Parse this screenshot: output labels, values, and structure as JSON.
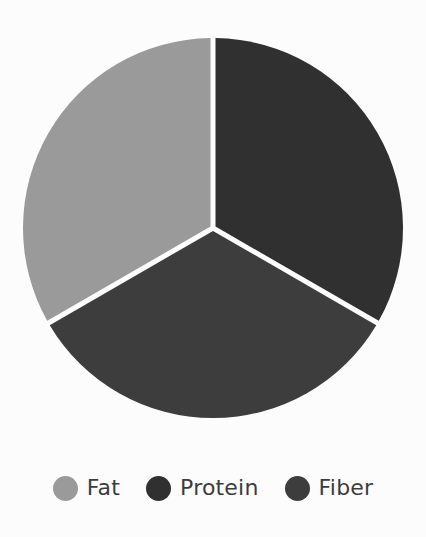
{
  "chart_data": {
    "type": "pie",
    "title": "",
    "subtitle": "",
    "xlabel": "",
    "ylabel": "",
    "grid": false,
    "legend_position": "bottom",
    "start_angle_deg": 0,
    "direction": "clockwise",
    "categories": [
      "Fat",
      "Protein",
      "Fiber"
    ],
    "values": [
      33.3,
      33.3,
      33.3
    ],
    "slices": [
      {
        "label": "Fat",
        "value": 33.3,
        "percent": "33.3%",
        "color": "#9a9a9a",
        "start_angle_deg": 240,
        "end_angle_deg": 360,
        "sweep_deg": 120,
        "position": "upper-left"
      },
      {
        "label": "Protein",
        "value": 33.3,
        "percent": "33.3%",
        "color": "#303030",
        "start_angle_deg": 0,
        "end_angle_deg": 120,
        "sweep_deg": 120,
        "position": "upper-right"
      },
      {
        "label": "Fiber",
        "value": 33.3,
        "percent": "33.3%",
        "color": "#3d3d3d",
        "start_angle_deg": 120,
        "end_angle_deg": 240,
        "sweep_deg": 120,
        "position": "bottom"
      }
    ],
    "geometry": {
      "center_x": 213,
      "center_y": 228,
      "radius": 190,
      "separator_color": "#fcfcfc",
      "separator_width": 5
    }
  },
  "legend": {
    "items": [
      {
        "label": "Fat",
        "color": "#9a9a9a",
        "marker": "circle-marker"
      },
      {
        "label": "Protein",
        "color": "#303030",
        "marker": "circle-marker"
      },
      {
        "label": "Fiber",
        "color": "#3d3d3d",
        "marker": "circle-marker"
      }
    ]
  },
  "canvas": {
    "background": "#fcfcfc",
    "width": 426,
    "height": 537
  }
}
